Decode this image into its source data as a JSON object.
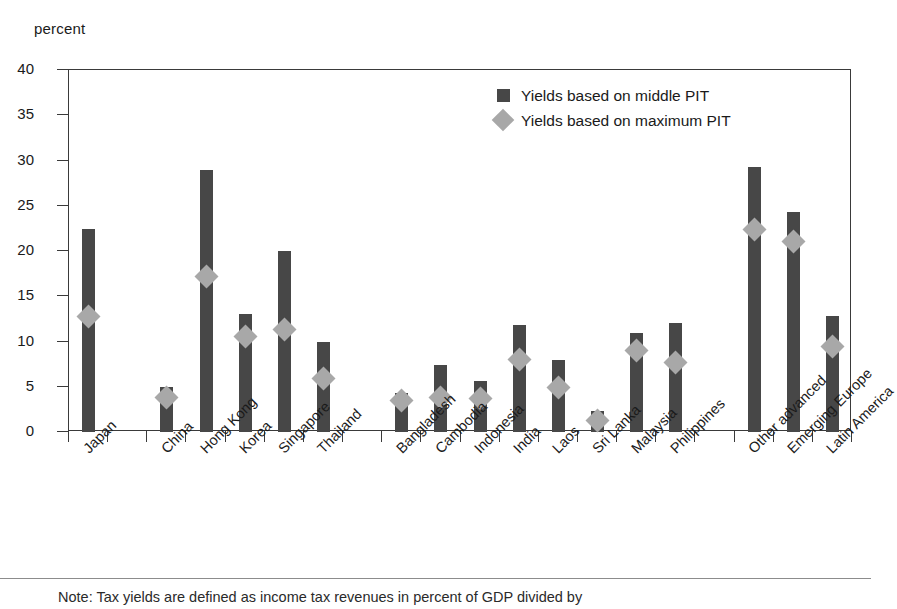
{
  "axis": {
    "y_title": "percent",
    "y_ticks": [
      0,
      5,
      10,
      15,
      20,
      25,
      30,
      35,
      40
    ]
  },
  "legend": {
    "items": [
      {
        "label": "Yields based on middle PIT",
        "marker": "square",
        "color": "#474747"
      },
      {
        "label": "Yields based on maximum PIT",
        "marker": "diamond",
        "color": "#a8a8a8"
      }
    ]
  },
  "note": "Note: Tax yields are defined as income tax revenues in percent of GDP divided by",
  "chart_data": {
    "type": "bar",
    "title": "",
    "xlabel": "",
    "ylabel": "percent",
    "ylim": [
      0,
      40
    ],
    "grid": false,
    "legend_position": "top-right",
    "categories": [
      "Japan",
      "",
      "China",
      "Hong Kong",
      "Korea",
      "Singapore",
      "Thailand",
      "",
      "Bangladesh",
      "Cambodia",
      "Indonesia",
      "India",
      "Laos",
      "Sri Lanka",
      "Malaysia",
      "Philippines",
      "",
      "Other advanced",
      "Emerging Europe",
      "Latin America"
    ],
    "series": [
      {
        "name": "Yields based on middle PIT",
        "marker": "bar",
        "color": "#474747",
        "values": [
          22.4,
          null,
          5.0,
          29.0,
          13.0,
          20.0,
          10.0,
          null,
          4.3,
          7.4,
          5.6,
          11.8,
          8.0,
          2.3,
          10.9,
          12.0,
          null,
          29.3,
          24.3,
          12.8
        ]
      },
      {
        "name": "Yields based on maximum PIT",
        "marker": "diamond",
        "color": "#a8a8a8",
        "values": [
          12.8,
          null,
          3.8,
          17.2,
          10.5,
          11.3,
          5.9,
          null,
          3.5,
          3.8,
          3.7,
          8.0,
          4.9,
          1.3,
          9.0,
          7.7,
          null,
          22.4,
          21.1,
          9.4
        ]
      }
    ]
  }
}
